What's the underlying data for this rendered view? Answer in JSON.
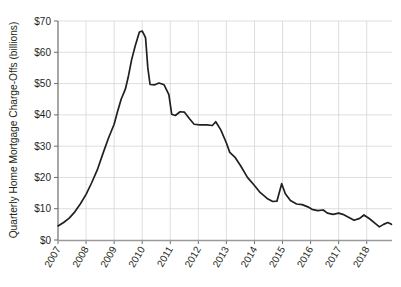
{
  "chart_data": {
    "type": "line",
    "title": "",
    "xlabel": "",
    "ylabel": "Quarterly Home Mortgage Charge-Offs (billions)",
    "xlim": [
      2007.0,
      2018.9
    ],
    "ylim": [
      0,
      70
    ],
    "grid": true,
    "legend": "none",
    "y_tick_labels": [
      "$0",
      "$10",
      "$20",
      "$30",
      "$40",
      "$50",
      "$60",
      "$70"
    ],
    "y_tick_values": [
      0,
      10,
      20,
      30,
      40,
      50,
      60,
      70
    ],
    "x_tick_labels": [
      "2007",
      "2008",
      "2009",
      "2010",
      "2011",
      "2012",
      "2013",
      "2014",
      "2015",
      "2016",
      "2017",
      "2018"
    ],
    "x_tick_values": [
      2007,
      2008,
      2009,
      2010,
      2011,
      2012,
      2013,
      2014,
      2015,
      2016,
      2017,
      2018
    ],
    "series": [
      {
        "name": "Quarterly Home Mortgage Charge-Offs",
        "color": "#231f20",
        "x": [
          2007.0,
          2007.25,
          2007.5,
          2007.75,
          2008.0,
          2008.25,
          2008.5,
          2008.75,
          2009.0,
          2009.25,
          2009.5,
          2009.75,
          2010.0,
          2010.25,
          2010.5,
          2010.75,
          2011.0,
          2011.25,
          2011.5,
          2011.75,
          2012.0,
          2012.25,
          2012.5,
          2012.75,
          2013.0,
          2013.25,
          2013.5,
          2013.75,
          2014.0,
          2014.25,
          2014.5,
          2014.75,
          2015.0,
          2015.25,
          2015.5,
          2015.75,
          2016.0,
          2016.25,
          2016.5,
          2016.75,
          2017.0,
          2017.25,
          2017.5,
          2017.75,
          2018.0,
          2018.25,
          2018.5,
          2018.75
        ],
        "values": [
          4.5,
          6.0,
          8.5,
          12.0,
          16.5,
          21.5,
          27.5,
          33.5,
          40.5,
          48.0,
          53.0,
          59.0,
          64.0,
          66.5,
          65.5,
          55.0,
          49.8,
          49.5,
          50.3,
          49.8,
          47.5,
          40.0,
          39.8,
          41.0,
          40.8,
          39.0,
          37.0,
          36.8,
          36.8,
          36.8,
          36.6,
          37.8,
          35.0,
          31.0,
          27.8,
          25.8,
          22.0,
          18.0,
          15.5,
          14.0,
          13.0,
          12.2,
          12.3,
          14.0,
          18.0,
          14.0,
          11.5,
          10.3
        ]
      }
    ],
    "series_tail": {
      "name": "Quarterly Home Mortgage Charge-Offs (continued)",
      "x": [
        2016.0,
        2016.25,
        2016.5,
        2016.75,
        2017.0,
        2017.25,
        2017.5,
        2017.75,
        2018.0,
        2018.25,
        2018.5,
        2018.75
      ],
      "values": [
        10.3,
        9.7,
        9.8,
        8.8,
        8.7,
        8.2,
        7.8,
        6.3,
        7.0,
        8.0,
        6.5,
        5.0
      ]
    },
    "annotations": [
      {
        "label": "peak",
        "x": 2009.6,
        "value": 66.5
      },
      {
        "label": "plateau-2010",
        "x": 2010.4,
        "value": 50.0
      },
      {
        "label": "plateau-2012",
        "x": 2012.2,
        "value": 37.0
      },
      {
        "label": "spike-2015",
        "x": 2014.95,
        "value": 18.0
      },
      {
        "label": "end",
        "x": 2018.85,
        "value": 5.0
      }
    ],
    "points": [
      [
        2007.0,
        4.5
      ],
      [
        2007.2,
        5.6
      ],
      [
        2007.4,
        7.0
      ],
      [
        2007.6,
        9.0
      ],
      [
        2007.8,
        11.6
      ],
      [
        2008.0,
        14.6
      ],
      [
        2008.2,
        18.3
      ],
      [
        2008.4,
        22.4
      ],
      [
        2008.6,
        27.6
      ],
      [
        2008.8,
        32.6
      ],
      [
        2009.0,
        37.0
      ],
      [
        2009.12,
        41.0
      ],
      [
        2009.25,
        45.0
      ],
      [
        2009.4,
        48.2
      ],
      [
        2009.5,
        52.0
      ],
      [
        2009.62,
        57.5
      ],
      [
        2009.75,
        62.0
      ],
      [
        2009.9,
        66.5
      ],
      [
        2010.0,
        66.8
      ],
      [
        2010.08,
        65.4
      ],
      [
        2010.12,
        64.6
      ],
      [
        2010.2,
        55.0
      ],
      [
        2010.28,
        49.7
      ],
      [
        2010.45,
        49.6
      ],
      [
        2010.6,
        50.2
      ],
      [
        2010.78,
        49.6
      ],
      [
        2010.95,
        46.5
      ],
      [
        2011.05,
        40.2
      ],
      [
        2011.18,
        39.8
      ],
      [
        2011.35,
        41.0
      ],
      [
        2011.5,
        40.9
      ],
      [
        2011.7,
        38.6
      ],
      [
        2011.85,
        37.0
      ],
      [
        2012.05,
        36.8
      ],
      [
        2012.3,
        36.8
      ],
      [
        2012.5,
        36.6
      ],
      [
        2012.62,
        37.8
      ],
      [
        2012.8,
        35.2
      ],
      [
        2013.0,
        31.0
      ],
      [
        2013.12,
        28.0
      ],
      [
        2013.3,
        26.5
      ],
      [
        2013.5,
        23.8
      ],
      [
        2013.75,
        20.0
      ],
      [
        2014.0,
        17.4
      ],
      [
        2014.2,
        15.2
      ],
      [
        2014.45,
        13.3
      ],
      [
        2014.65,
        12.3
      ],
      [
        2014.8,
        12.4
      ],
      [
        2014.97,
        18.0
      ],
      [
        2015.1,
        14.8
      ],
      [
        2015.28,
        12.6
      ],
      [
        2015.5,
        11.5
      ],
      [
        2015.7,
        11.3
      ],
      [
        2015.9,
        10.6
      ],
      [
        2016.05,
        9.8
      ],
      [
        2016.25,
        9.4
      ],
      [
        2016.45,
        9.6
      ],
      [
        2016.6,
        8.6
      ],
      [
        2016.8,
        8.2
      ],
      [
        2017.0,
        8.6
      ],
      [
        2017.15,
        8.2
      ],
      [
        2017.35,
        7.3
      ],
      [
        2017.55,
        6.3
      ],
      [
        2017.75,
        6.9
      ],
      [
        2017.9,
        8.0
      ],
      [
        2018.1,
        6.8
      ],
      [
        2018.3,
        5.3
      ],
      [
        2018.45,
        4.2
      ],
      [
        2018.6,
        5.0
      ],
      [
        2018.75,
        5.6
      ],
      [
        2018.88,
        5.0
      ]
    ]
  }
}
